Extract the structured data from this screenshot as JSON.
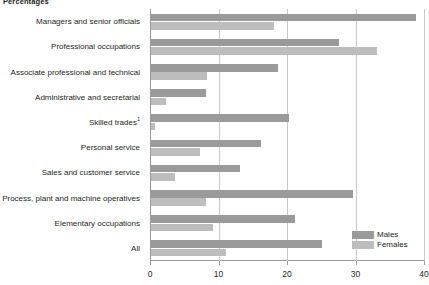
{
  "unit_label": "Percentages",
  "chart_data": {
    "type": "bar",
    "orientation": "horizontal",
    "title": "",
    "subtitle": "",
    "xlabel": "",
    "ylabel": "",
    "unit": "Percentages",
    "xlim": [
      0,
      40
    ],
    "xticks": [
      0,
      10,
      20,
      30,
      40
    ],
    "xtick_labels": [
      "0",
      "10",
      "20",
      "30",
      "40"
    ],
    "grid": true,
    "grid_axis": "x",
    "legend_position": "bottom-right",
    "categories": [
      "Managers and senior officials",
      "Professional occupations",
      "Associate professional and technical",
      "Administrative and secretarial",
      "Skilled trades",
      "Personal service",
      "Sales and customer service",
      "Process, plant and machine operatives",
      "Elementary occupations",
      "All"
    ],
    "category_footnotes": [
      "",
      "",
      "",
      "",
      "1",
      "",
      "",
      "",
      "",
      ""
    ],
    "series": [
      {
        "name": "Males",
        "color": "#9a9a9a",
        "values": [
          38.7,
          27.5,
          18.5,
          8.0,
          20.2,
          16.0,
          13.0,
          29.5,
          21.0,
          25.0
        ]
      },
      {
        "name": "Females",
        "color": "#bdbdbd",
        "values": [
          18.0,
          33.0,
          8.2,
          2.2,
          0.6,
          7.2,
          3.5,
          8.0,
          9.0,
          11.0
        ]
      }
    ]
  },
  "legend": {
    "items": [
      {
        "label": "Males",
        "color": "#9a9a9a"
      },
      {
        "label": "Females",
        "color": "#bdbdbd"
      }
    ]
  },
  "axis": {
    "tick_labels": [
      "0",
      "10",
      "20",
      "30",
      "40"
    ]
  }
}
